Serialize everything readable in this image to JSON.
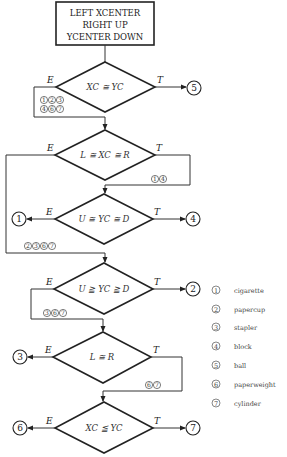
{
  "start_box": {
    "lines": [
      "LEFT XCENTER",
      "RIGHT UP",
      "YCENTER DOWN"
    ]
  },
  "branch_labels": {
    "else": "E",
    "then": "T"
  },
  "decisions": [
    {
      "id": "d1",
      "condition": "XC ≅ YC",
      "true_target": "5",
      "false_items": [
        "1",
        "2",
        "3",
        "4",
        "6",
        "7"
      ]
    },
    {
      "id": "d2",
      "condition": "L ≅ XC ≅ R",
      "true_items": [
        "1",
        "4"
      ],
      "false_items": [
        "2",
        "3",
        "6",
        "7"
      ]
    },
    {
      "id": "d3",
      "condition": "U ≅ YC ≅ D",
      "true_target": "4",
      "false_target": "1"
    },
    {
      "id": "d4",
      "condition": "U ≧ YC ≧ D",
      "true_target": "2",
      "false_items": [
        "3",
        "6",
        "7"
      ]
    },
    {
      "id": "d5",
      "condition": "L ≅ R",
      "false_target": "3",
      "true_items": [
        "6",
        "7"
      ]
    },
    {
      "id": "d6",
      "condition": "XC ≦ YC",
      "false_target": "6",
      "true_target": "7"
    }
  ],
  "legend": [
    {
      "num": "1",
      "label": "cigarette"
    },
    {
      "num": "2",
      "label": "papercup"
    },
    {
      "num": "3",
      "label": "stapler"
    },
    {
      "num": "4",
      "label": "block"
    },
    {
      "num": "5",
      "label": "ball"
    },
    {
      "num": "6",
      "label": "paperweight"
    },
    {
      "num": "7",
      "label": "cylinder"
    }
  ]
}
